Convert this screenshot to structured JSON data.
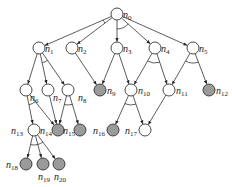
{
  "diagram": {
    "type": "and-or-graph",
    "colors": {
      "open_fill": "#ffffff",
      "solved_fill": "#9a9a9a",
      "stroke": "#333333",
      "background": "#ffffff"
    },
    "nodes": [
      {
        "id": "n0",
        "label": "n",
        "sub": "0",
        "x": 117,
        "y": 14,
        "solved": false,
        "lx": 6,
        "ly": 4
      },
      {
        "id": "n1",
        "label": "n",
        "sub": "1",
        "x": 39,
        "y": 48,
        "solved": false,
        "lx": 6,
        "ly": 4
      },
      {
        "id": "n2",
        "label": "n",
        "sub": "2",
        "x": 72,
        "y": 48,
        "solved": false,
        "lx": 6,
        "ly": 4
      },
      {
        "id": "n3",
        "label": "n",
        "sub": "3",
        "x": 117,
        "y": 48,
        "solved": false,
        "lx": 6,
        "ly": 4
      },
      {
        "id": "n4",
        "label": "n",
        "sub": "4",
        "x": 155,
        "y": 48,
        "solved": false,
        "lx": 6,
        "ly": 4
      },
      {
        "id": "n5",
        "label": "n",
        "sub": "5",
        "x": 193,
        "y": 48,
        "solved": false,
        "lx": 6,
        "ly": 4
      },
      {
        "id": "n6",
        "label": "n",
        "sub": "6",
        "x": 26,
        "y": 90,
        "solved": false,
        "lx": 4,
        "ly": 11
      },
      {
        "id": "n7",
        "label": "n",
        "sub": "7",
        "x": 48,
        "y": 90,
        "solved": false,
        "lx": 5,
        "ly": 11
      },
      {
        "id": "n8",
        "label": "n",
        "sub": "8",
        "x": 68,
        "y": 90,
        "solved": false,
        "lx": 10,
        "ly": 11
      },
      {
        "id": "n9",
        "label": "n",
        "sub": "9",
        "x": 100,
        "y": 90,
        "solved": true,
        "lx": 7,
        "ly": 4
      },
      {
        "id": "n10",
        "label": "n",
        "sub": "10",
        "x": 131,
        "y": 90,
        "solved": false,
        "lx": 7,
        "ly": 4
      },
      {
        "id": "n11",
        "label": "n",
        "sub": "11",
        "x": 169,
        "y": 90,
        "solved": false,
        "lx": 7,
        "ly": 4
      },
      {
        "id": "n12",
        "label": "n",
        "sub": "12",
        "x": 209,
        "y": 90,
        "solved": true,
        "lx": 7,
        "ly": 4
      },
      {
        "id": "n13",
        "label": "n",
        "sub": "13",
        "x": 34,
        "y": 130,
        "solved": false,
        "lx": -23,
        "ly": 4
      },
      {
        "id": "n14",
        "label": "n",
        "sub": "14",
        "x": 58,
        "y": 130,
        "solved": true,
        "lx": -18,
        "ly": 4
      },
      {
        "id": "n15",
        "label": "n",
        "sub": "15",
        "x": 80,
        "y": 130,
        "solved": true,
        "lx": -17,
        "ly": 4
      },
      {
        "id": "n16",
        "label": "n",
        "sub": "16",
        "x": 113,
        "y": 130,
        "solved": true,
        "lx": -20,
        "ly": 4
      },
      {
        "id": "n17",
        "label": "n",
        "sub": "17",
        "x": 145,
        "y": 130,
        "solved": false,
        "lx": -20,
        "ly": 4
      },
      {
        "id": "n18",
        "label": "n",
        "sub": "18",
        "x": 26,
        "y": 164,
        "solved": true,
        "lx": -20,
        "ly": 4
      },
      {
        "id": "n19",
        "label": "n",
        "sub": "19",
        "x": 43,
        "y": 164,
        "solved": true,
        "lx": -5,
        "ly": 16
      },
      {
        "id": "n20",
        "label": "n",
        "sub": "20",
        "x": 59,
        "y": 164,
        "solved": true,
        "lx": -5,
        "ly": 16
      }
    ],
    "edges": [
      [
        "n0",
        "n1"
      ],
      [
        "n0",
        "n2"
      ],
      [
        "n0",
        "n3"
      ],
      [
        "n0",
        "n4"
      ],
      [
        "n0",
        "n5"
      ],
      [
        "n1",
        "n6"
      ],
      [
        "n1",
        "n7"
      ],
      [
        "n1",
        "n8"
      ],
      [
        "n2",
        "n9"
      ],
      [
        "n3",
        "n9"
      ],
      [
        "n3",
        "n10"
      ],
      [
        "n4",
        "n10"
      ],
      [
        "n4",
        "n11"
      ],
      [
        "n5",
        "n11"
      ],
      [
        "n5",
        "n12"
      ],
      [
        "n6",
        "n13"
      ],
      [
        "n6",
        "n14"
      ],
      [
        "n7",
        "n14"
      ],
      [
        "n8",
        "n14"
      ],
      [
        "n8",
        "n15"
      ],
      [
        "n10",
        "n16"
      ],
      [
        "n10",
        "n17"
      ],
      [
        "n11",
        "n17"
      ],
      [
        "n13",
        "n18"
      ],
      [
        "n13",
        "n19"
      ],
      [
        "n13",
        "n20"
      ]
    ],
    "and_arcs": [
      {
        "from": "n0",
        "to": [
          "n1",
          "n2"
        ]
      },
      {
        "from": "n0",
        "to": [
          "n3",
          "n4"
        ]
      },
      {
        "from": "n1",
        "to": [
          "n7",
          "n8"
        ]
      },
      {
        "from": "n4",
        "to": [
          "n10",
          "n11"
        ]
      },
      {
        "from": "n5",
        "to": [
          "n11",
          "n12"
        ]
      },
      {
        "from": "n6",
        "to": [
          "n13",
          "n14"
        ]
      },
      {
        "from": "n8",
        "to": [
          "n14",
          "n15"
        ]
      },
      {
        "from": "n10",
        "to": [
          "n16",
          "n17"
        ]
      },
      {
        "from": "n13",
        "to": [
          "n18",
          "n19"
        ]
      },
      {
        "from": "n13",
        "to": [
          "n19",
          "n20"
        ]
      }
    ]
  }
}
